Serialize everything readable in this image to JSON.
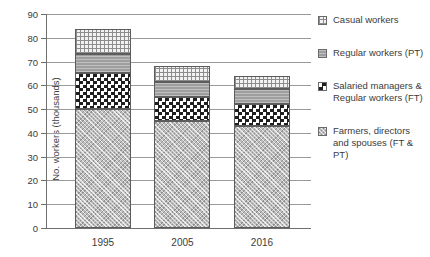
{
  "chart_data": {
    "type": "bar",
    "subtype": "stacked-column",
    "title": "",
    "xlabel": "",
    "ylabel": "No. workers (thousands)",
    "categories": [
      "1995",
      "2005",
      "2016"
    ],
    "ylim": [
      0,
      90
    ],
    "yticks": [
      0,
      10,
      20,
      30,
      40,
      50,
      60,
      70,
      80,
      90
    ],
    "grid": true,
    "legend_position": "right",
    "series": [
      {
        "name": "Farmers, directors and spouses (FT & PT)",
        "pattern": "diagonal-crosshatch-light-grey",
        "color": "#bdbdbd",
        "values": [
          50,
          45,
          43
        ]
      },
      {
        "name": "Salaried managers & Regular workers (FT)",
        "pattern": "checkerboard-black-white",
        "color": "#1f1f1f",
        "values": [
          15,
          10,
          9
        ]
      },
      {
        "name": "Regular workers (PT)",
        "pattern": "solid-mid-grey",
        "color": "#9e9e9e",
        "values": [
          8,
          6.5,
          6.5
        ]
      },
      {
        "name": "Casual workers",
        "pattern": "fine-grid-light",
        "color": "#f2f2f2",
        "values": [
          10.5,
          6.5,
          5.5
        ]
      }
    ],
    "totals": [
      83.5,
      68,
      64
    ]
  },
  "axes": {
    "y_title": "No. workers (thousands)",
    "y_tick_labels": [
      "90",
      "80",
      "70",
      "60",
      "50",
      "40",
      "30",
      "20",
      "10",
      "0"
    ],
    "x_tick_labels": [
      "1995",
      "2005",
      "2016"
    ]
  },
  "legend": {
    "items": [
      {
        "label": "Casual workers",
        "swatch": "legend-swatch-casual-workers"
      },
      {
        "label": "Regular workers (PT)",
        "swatch": "legend-swatch-regular-workers-pt"
      },
      {
        "label": "Salaried managers & Regular workers (FT)",
        "swatch": "legend-swatch-salaried-managers"
      },
      {
        "label": "Farmers, directors and spouses (FT & PT)",
        "swatch": "legend-swatch-farmers-directors"
      }
    ]
  },
  "colors": {
    "axis": "#6f6f6f",
    "gridline": "#9a9a9a",
    "text": "#3b3b3b",
    "background": "#ffffff"
  }
}
